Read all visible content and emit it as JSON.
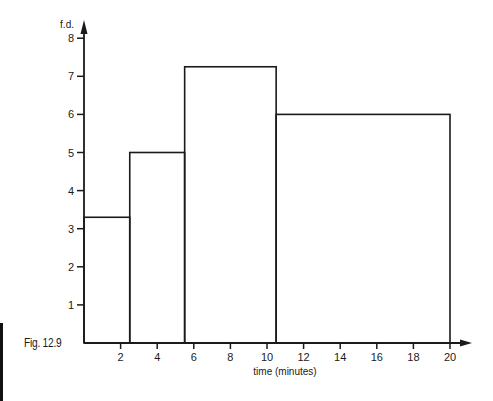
{
  "figure": {
    "caption": "Fig. 12.9"
  },
  "chart_data": {
    "type": "bar",
    "subtype": "histogram",
    "title": "",
    "xlabel": "time (minutes)",
    "ylabel": "f.d.",
    "xlim": [
      0,
      20
    ],
    "ylim": [
      0,
      8
    ],
    "grid": false,
    "legend": null,
    "x_ticks": [
      2,
      4,
      6,
      8,
      10,
      12,
      14,
      16,
      18,
      20
    ],
    "y_ticks": [
      1,
      2,
      3,
      4,
      5,
      6,
      7,
      8
    ],
    "bins": [
      {
        "from": 0,
        "to": 2.5,
        "fd": 3.3
      },
      {
        "from": 2.5,
        "to": 5.5,
        "fd": 5
      },
      {
        "from": 5.5,
        "to": 10.5,
        "fd": 7.25
      },
      {
        "from": 10.5,
        "to": 20,
        "fd": 6
      }
    ],
    "categories": [
      "0-2.5",
      "2.5-5.5",
      "5.5-10.5",
      "10.5-20"
    ],
    "values": [
      3.3,
      5,
      7.25,
      6
    ]
  },
  "colors": {
    "line": "#1a1a1a",
    "background": "#ffffff"
  }
}
